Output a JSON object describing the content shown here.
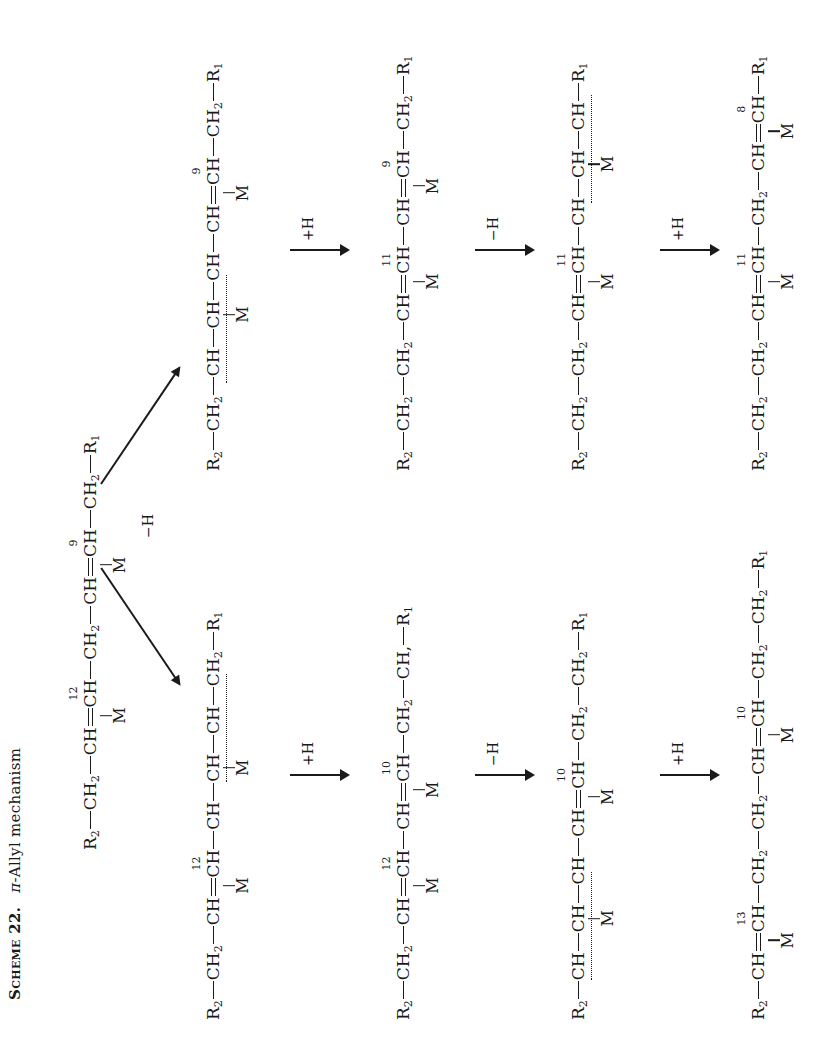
{
  "title": {
    "scheme": "Scheme 22.",
    "pi": "π",
    "caption": "-Allyl mechanism"
  },
  "start": {
    "parts": [
      "R",
      "2",
      "CH",
      "2",
      "CH",
      "CH",
      "CH",
      "2",
      "CH",
      "CH",
      "CH",
      "2",
      "R",
      "1"
    ],
    "num_left": "12",
    "num_right": "9",
    "metal": "M"
  },
  "branch_label": "−H",
  "arrows": {
    "step1": "+H",
    "step2": "−H",
    "step3": "+H"
  },
  "left_branch": {
    "s1": {
      "num": "12",
      "metal_a": "M",
      "metal_b": "M"
    },
    "s2": {
      "num_a": "12",
      "num_b": "10",
      "metal_a": "M",
      "metal_b": "M",
      "tail": "CH,"
    },
    "s3": {
      "num": "10",
      "metal_a": "M",
      "metal_b": "M"
    },
    "s4": {
      "num_a": "13",
      "num_b": "10",
      "metal_a": "M",
      "metal_b": "M"
    }
  },
  "right_branch": {
    "s1": {
      "num": "9",
      "metal_a": "M",
      "metal_b": "M"
    },
    "s2": {
      "num_a": "11",
      "num_b": "9",
      "metal_a": "M",
      "metal_b": "M"
    },
    "s3": {
      "num": "11",
      "metal_a": "M",
      "metal_b": "M"
    },
    "s4": {
      "num_a": "11",
      "num_b": "8",
      "metal_a": "M",
      "metal_b": "M"
    }
  },
  "atoms": {
    "R": "R",
    "CH": "CH",
    "C": "C",
    "H2": "H",
    "two": "2",
    "one": "1",
    "M": "M"
  }
}
